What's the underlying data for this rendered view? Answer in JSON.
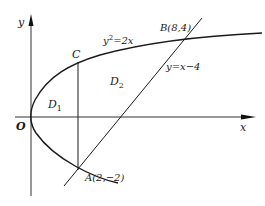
{
  "figure": {
    "axes": {
      "x_label": "x",
      "y_label": "y",
      "origin_label": "O"
    },
    "curves": [
      {
        "name": "parabola",
        "equation_label": "y²=2x",
        "equation_lhs": "y",
        "equation_sup": "2",
        "equation_rhs": "=2x"
      },
      {
        "name": "line",
        "equation_label": "y=x−4"
      }
    ],
    "points": {
      "A": {
        "label": "A(2,−2)",
        "x": 2,
        "y": -2
      },
      "B": {
        "label": "B(8,4)",
        "x": 8,
        "y": 4
      },
      "C": {
        "label": "C"
      }
    },
    "regions": {
      "D1": {
        "letter": "D",
        "sub": "1"
      },
      "D2": {
        "letter": "D",
        "sub": "2"
      }
    },
    "colors": {
      "stroke": "#1a1a1a",
      "axis": "#333333",
      "background": "#ffffff"
    }
  }
}
